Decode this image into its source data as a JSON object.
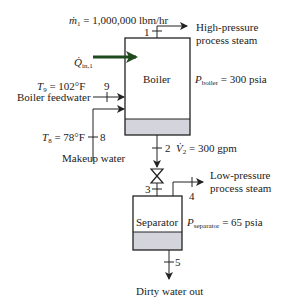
{
  "diagram": {
    "boiler": {
      "label": "Boiler",
      "pressure_symbol": "P",
      "pressure_subscript": "boiler",
      "pressure_value": "= 300 psia"
    },
    "separator": {
      "label": "Separator",
      "pressure_symbol": "P",
      "pressure_subscript": "separator",
      "pressure_value": "= 65 psia"
    },
    "streams": {
      "s1": {
        "number": "1",
        "mass_flow_symbol": "ṁ",
        "mass_flow_subscript": "1",
        "mass_flow_value": "= 1,000,000 lbm/hr",
        "label_line1": "High-pressure",
        "label_line2": "process steam"
      },
      "s2": {
        "number": "2",
        "vol_flow_symbol": "V̇",
        "vol_flow_subscript": "2",
        "vol_flow_value": "= 300 gpm"
      },
      "s3": {
        "number": "3"
      },
      "s4": {
        "number": "4",
        "label_line1": "Low-pressure",
        "label_line2": "process steam"
      },
      "s5": {
        "number": "5",
        "label": "Dirty water out"
      },
      "s8": {
        "number": "8",
        "temp_symbol": "T",
        "temp_subscript": "8",
        "temp_value": "= 78°F",
        "label": "Makeup water"
      },
      "s9": {
        "number": "9",
        "temp_symbol": "T",
        "temp_subscript": "9",
        "temp_value": "= 102°F",
        "label": "Boiler feedwater"
      }
    },
    "heat_input": {
      "symbol": "Q̇",
      "subscript": "in,1"
    },
    "colors": {
      "line": "#222222",
      "liquid_fill": "#d4d4dc",
      "heat_arrow": "#1e4a1e"
    }
  }
}
